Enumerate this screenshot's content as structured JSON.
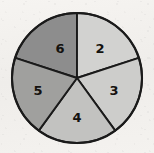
{
  "figure": {
    "name": "pie-chart-five-sectors",
    "background_color": "#f2f0ed",
    "outline_color": "#1a1a1a"
  },
  "chart_data": {
    "type": "pie",
    "title": "",
    "subtitle": "",
    "xlabel": "",
    "ylabel": "",
    "legend": "none",
    "grid": false,
    "center": {
      "x": 77,
      "y": 78
    },
    "radius": 65,
    "start_angle_deg": 0,
    "direction": "clockwise",
    "categories": [
      "6",
      "2",
      "3",
      "4",
      "5"
    ],
    "values": [
      72,
      72,
      72,
      72,
      72
    ],
    "labels": [
      "6",
      "2",
      "3",
      "4",
      "5"
    ],
    "colors": [
      "#8d8d8d",
      "#d2d2d0",
      "#cdcdcb",
      "#c2c2c0",
      "#a0a09e"
    ],
    "slices": [
      {
        "label": "6",
        "value": 72,
        "start_deg": 288,
        "end_deg": 360,
        "color": "#8d8d8d",
        "label_x": 60,
        "label_y": 48
      },
      {
        "label": "2",
        "value": 72,
        "start_deg": 0,
        "end_deg": 72,
        "color": "#d2d2d0",
        "label_x": 100,
        "label_y": 48
      },
      {
        "label": "3",
        "value": 72,
        "start_deg": 72,
        "end_deg": 144,
        "color": "#cdcdcb",
        "label_x": 114,
        "label_y": 90
      },
      {
        "label": "4",
        "value": 72,
        "start_deg": 144,
        "end_deg": 216,
        "color": "#c2c2c0",
        "label_x": 77,
        "label_y": 117
      },
      {
        "label": "5",
        "value": 72,
        "start_deg": 216,
        "end_deg": 288,
        "color": "#a0a09e",
        "label_x": 38,
        "label_y": 90
      }
    ]
  }
}
